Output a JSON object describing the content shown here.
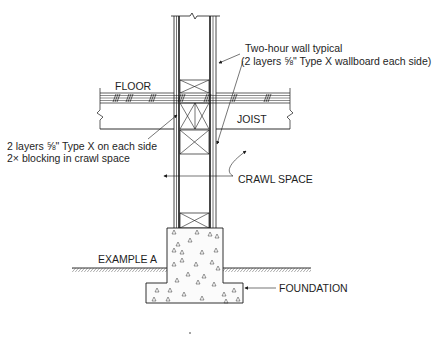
{
  "diagram": {
    "labels": {
      "wall_note_line1": "Two-hour wall typical",
      "wall_note_line2": "(2 layers ⅝\" Type X wallboard each side)",
      "floor": "FLOOR",
      "joist": "JOIST",
      "blocking_note_line1": "2 layers ⅝\" Type X on each side",
      "blocking_note_line2": "2×  blocking in crawl space",
      "crawl_space": "CRAWL SPACE",
      "example": "EXAMPLE A",
      "foundation": "FOUNDATION"
    },
    "components": [
      {
        "id": "wall",
        "description": "Stud wall with 2 layers 5/8 in. Type X wallboard each side"
      },
      {
        "id": "floor",
        "description": "Floor decking (hatched)"
      },
      {
        "id": "joist",
        "description": "Floor joist"
      },
      {
        "id": "blocking",
        "description": "2x blocking with X-bracing in crawl space"
      },
      {
        "id": "foundation",
        "description": "Concrete stem wall and footing"
      },
      {
        "id": "ground",
        "description": "Grade line (hatched)"
      }
    ],
    "colors": {
      "ink": "#1a1a1a",
      "background": "#ffffff"
    }
  }
}
